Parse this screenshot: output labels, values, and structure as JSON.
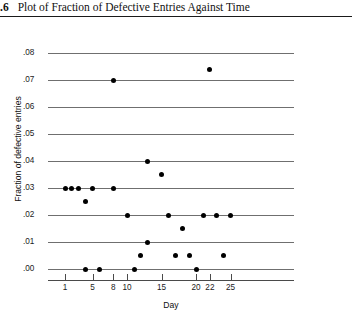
{
  "caption": {
    "number": ".6",
    "text": "Plot of Fraction of Defective Entries Against Time"
  },
  "chart_data": {
    "type": "scatter",
    "title": "Plot of Fraction of Defective Entries Against Time",
    "xlabel": "Day",
    "ylabel": "Fraction of defective entries",
    "xlim": [
      0,
      27
    ],
    "ylim": [
      0.0,
      0.08
    ],
    "grid": "horizontal",
    "legend": "none",
    "xticks": [
      1,
      5,
      8,
      10,
      15,
      20,
      22,
      25
    ],
    "xtick_labels": [
      "1",
      "5",
      "8",
      "10",
      "15",
      "20",
      "22",
      "25"
    ],
    "yticks": [
      0.0,
      0.01,
      0.02,
      0.03,
      0.04,
      0.05,
      0.06,
      0.07,
      0.08
    ],
    "ytick_labels": [
      ".00",
      ".01",
      ".02",
      ".03",
      ".04",
      ".05",
      ".06",
      ".07",
      ".08"
    ],
    "marker": "filled-circle",
    "marker_color": "#000000",
    "points": [
      {
        "x": 1,
        "y": 0.03
      },
      {
        "x": 2,
        "y": 0.03
      },
      {
        "x": 3,
        "y": 0.03
      },
      {
        "x": 4,
        "y": 0.025
      },
      {
        "x": 4,
        "y": 0.0
      },
      {
        "x": 5,
        "y": 0.03
      },
      {
        "x": 6,
        "y": 0.0
      },
      {
        "x": 8,
        "y": 0.03
      },
      {
        "x": 8,
        "y": 0.07
      },
      {
        "x": 10,
        "y": 0.02
      },
      {
        "x": 11,
        "y": 0.0
      },
      {
        "x": 12,
        "y": 0.005
      },
      {
        "x": 13,
        "y": 0.04
      },
      {
        "x": 13,
        "y": 0.01
      },
      {
        "x": 15,
        "y": 0.035
      },
      {
        "x": 16,
        "y": 0.02
      },
      {
        "x": 17,
        "y": 0.005
      },
      {
        "x": 18,
        "y": 0.015
      },
      {
        "x": 19,
        "y": 0.005
      },
      {
        "x": 20,
        "y": 0.0
      },
      {
        "x": 21,
        "y": 0.02
      },
      {
        "x": 22,
        "y": 0.074
      },
      {
        "x": 23,
        "y": 0.02
      },
      {
        "x": 24,
        "y": 0.005
      },
      {
        "x": 25,
        "y": 0.02
      }
    ]
  }
}
